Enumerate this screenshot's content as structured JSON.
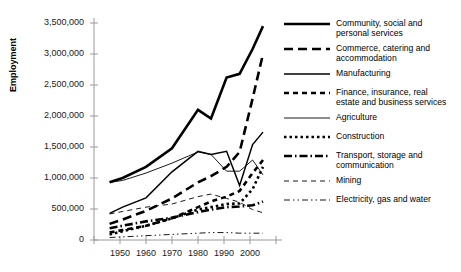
{
  "chart_data": {
    "type": "line",
    "title": "",
    "xlabel": "",
    "ylabel": "Employment",
    "xlim": [
      1940,
      2010
    ],
    "ylim": [
      0,
      3500000
    ],
    "grid": false,
    "legend_position": "right",
    "x_ticks": [
      1940,
      1950,
      1960,
      1970,
      1980,
      1990,
      2000,
      2010
    ],
    "x_tick_labels": [
      "",
      "1950",
      "1960",
      "1970",
      "1980",
      "1990",
      "2000",
      ""
    ],
    "y_ticks": [
      0,
      500000,
      1000000,
      1500000,
      2000000,
      2500000,
      3000000,
      3500000
    ],
    "y_tick_labels": [
      "0",
      "500,000",
      "1,000,000",
      "1,500,000",
      "2,000,000",
      "2,500,000",
      "3,000,000",
      "3,500,000"
    ],
    "x": [
      1946,
      1951,
      1960,
      1970,
      1980,
      1985,
      1991,
      1996,
      2001,
      2005
    ],
    "series": [
      {
        "name": "Community, social and personal services",
        "style": "thick-solid",
        "values": [
          930000,
          1000000,
          1180000,
          1480000,
          2100000,
          1960000,
          2620000,
          2680000,
          3080000,
          3450000
        ]
      },
      {
        "name": "Commerce, catering and accommodation",
        "style": "thick-longdash",
        "values": [
          260000,
          330000,
          470000,
          670000,
          930000,
          1030000,
          1180000,
          1420000,
          2280000,
          3000000
        ]
      },
      {
        "name": "Manufacturing",
        "style": "medium-solid",
        "values": [
          430000,
          530000,
          680000,
          1100000,
          1430000,
          1380000,
          1430000,
          880000,
          1540000,
          1740000
        ]
      },
      {
        "name": "Finance, insurance, real estate and business services",
        "style": "thick-dash",
        "values": [
          120000,
          160000,
          230000,
          350000,
          530000,
          620000,
          700000,
          790000,
          1080000,
          1290000
        ]
      },
      {
        "name": "Agriculture",
        "style": "thin-solid",
        "values": [
          930000,
          960000,
          1080000,
          1240000,
          1420000,
          1380000,
          1110000,
          1110000,
          1290000,
          1050000
        ]
      },
      {
        "name": "Construction",
        "style": "thick-dotted",
        "values": [
          90000,
          140000,
          230000,
          350000,
          490000,
          530000,
          580000,
          590000,
          820000,
          1180000
        ]
      },
      {
        "name": "Transport, storage and communication",
        "style": "thick-dashdot",
        "values": [
          190000,
          230000,
          300000,
          360000,
          450000,
          490000,
          530000,
          540000,
          560000,
          620000
        ]
      },
      {
        "name": "Mining",
        "style": "thin-dash",
        "values": [
          420000,
          460000,
          530000,
          580000,
          700000,
          740000,
          670000,
          610000,
          490000,
          440000
        ]
      },
      {
        "name": "Electricity, gas and water",
        "style": "thin-dashdotdot",
        "values": [
          40000,
          50000,
          70000,
          90000,
          110000,
          120000,
          120000,
          110000,
          110000,
          110000
        ]
      }
    ]
  },
  "legend": {
    "items": [
      {
        "label": "Community, social and\npersonal services",
        "style": "thick-solid"
      },
      {
        "label": "Commerce, catering and\naccommodation",
        "style": "thick-longdash"
      },
      {
        "label": "Manufacturing",
        "style": "medium-solid"
      },
      {
        "label": "Finance, insurance, real\nestate and business services",
        "style": "thick-dash"
      },
      {
        "label": "Agriculture",
        "style": "thin-solid"
      },
      {
        "label": "Construction",
        "style": "thick-dotted"
      },
      {
        "label": "Transport, storage and\ncommunication",
        "style": "thick-dashdot"
      },
      {
        "label": "Mining",
        "style": "thin-dash"
      },
      {
        "label": "Electricity, gas and water",
        "style": "thin-dashdotdot"
      }
    ]
  }
}
